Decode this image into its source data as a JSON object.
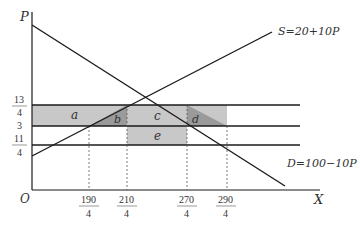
{
  "axes": {
    "y_label": "P",
    "x_label": "X",
    "origin_label": "O"
  },
  "curves": {
    "supply_label": "S=20+10P",
    "demand_label": "D=100−10P"
  },
  "y_ticks": [
    {
      "num": "13",
      "den": "4",
      "value": 3.25
    },
    {
      "num": "3",
      "den": "",
      "value": 3
    },
    {
      "num": "11",
      "den": "4",
      "value": 2.75
    }
  ],
  "x_ticks": [
    {
      "num": "190",
      "den": "4",
      "value": 47.5
    },
    {
      "num": "210",
      "den": "4",
      "value": 52.5
    },
    {
      "num": "270",
      "den": "4",
      "value": 67.5
    },
    {
      "num": "290",
      "den": "4",
      "value": 72.5
    }
  ],
  "regions": {
    "a": "a",
    "b": "b",
    "c": "c",
    "d": "d",
    "e": "e"
  },
  "colors": {
    "light_shade": "#c8c8c8",
    "dark_shade": "#9a9a9a",
    "line": "#1a1a1a"
  }
}
